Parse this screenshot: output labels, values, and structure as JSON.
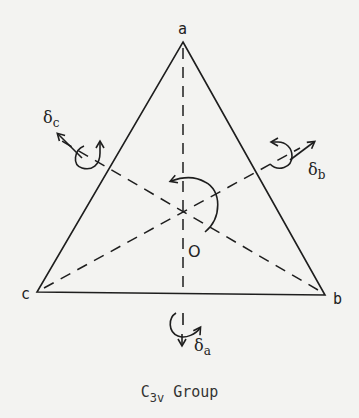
{
  "diagram": {
    "type": "symmetry-diagram",
    "vertices": {
      "a": {
        "label": "a",
        "x": 183,
        "y": 42
      },
      "b": {
        "label": "b",
        "x": 325,
        "y": 295
      },
      "c": {
        "label": "c",
        "x": 37,
        "y": 292
      }
    },
    "center": {
      "label": "O",
      "x": 185,
      "y": 210
    },
    "motions": [
      {
        "id": "delta_a",
        "symbol": "δ",
        "subscript": "a"
      },
      {
        "id": "delta_b",
        "symbol": "δ",
        "subscript": "b"
      },
      {
        "id": "delta_c",
        "symbol": "δ",
        "subscript": "c"
      }
    ],
    "caption": {
      "main": "C",
      "subscript": "3v",
      "suffix": " Group"
    },
    "colors": {
      "ink": "#1e1e1e",
      "paper": "#f3f3f1"
    }
  }
}
